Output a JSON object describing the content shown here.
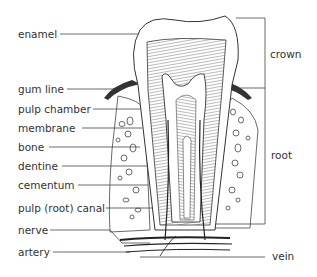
{
  "diagram": {
    "labels_left": [
      {
        "id": "enamel",
        "text": "enamel",
        "x": 18,
        "y": 28
      },
      {
        "id": "gum-line",
        "text": "gum line",
        "x": 18,
        "y": 83
      },
      {
        "id": "pulp-chamber",
        "text": "pulp chamber",
        "x": 18,
        "y": 103
      },
      {
        "id": "membrane",
        "text": "membrane",
        "x": 18,
        "y": 122
      },
      {
        "id": "bone",
        "text": "bone",
        "x": 18,
        "y": 141
      },
      {
        "id": "dentine",
        "text": "dentine",
        "x": 18,
        "y": 160
      },
      {
        "id": "cementum",
        "text": "cementum",
        "x": 18,
        "y": 179
      },
      {
        "id": "pulp-root-canal",
        "text": "pulp (root) canal",
        "x": 18,
        "y": 202
      },
      {
        "id": "nerve",
        "text": "nerve",
        "x": 18,
        "y": 224
      },
      {
        "id": "artery",
        "text": "artery",
        "x": 18,
        "y": 246
      }
    ],
    "labels_right": [
      {
        "id": "crown",
        "text": "crown",
        "x": 270,
        "y": 48
      },
      {
        "id": "root",
        "text": "root",
        "x": 271,
        "y": 149
      },
      {
        "id": "vein",
        "text": "vein",
        "x": 272,
        "y": 250
      }
    ]
  }
}
